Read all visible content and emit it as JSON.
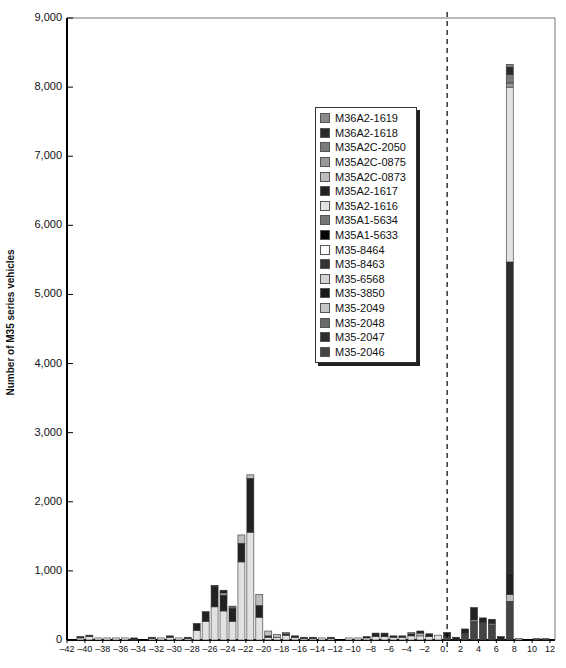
{
  "chart_data": {
    "type": "bar",
    "stacked": true,
    "title": "",
    "xlabel": "(x-axis title cut off at bottom of image)",
    "ylabel": "Number of M35 series vehicles",
    "ylim": [
      0,
      9000
    ],
    "xlim": [
      -42,
      12
    ],
    "yticks": [
      "0",
      "1,000",
      "2,000",
      "3,000",
      "4,000",
      "5,000",
      "6,000",
      "7,000",
      "8,000",
      "9,000"
    ],
    "xticks": [
      "-42",
      "-40",
      "-38",
      "-36",
      "-34",
      "-32",
      "-30",
      "-28",
      "-26",
      "-24",
      "-22",
      "-20",
      "-18",
      "-16",
      "-14",
      "-12",
      "-10",
      "-8",
      "-6",
      "-4",
      "-2",
      "0",
      "2",
      "4",
      "6",
      "8",
      "10",
      "12"
    ],
    "reference_line": {
      "x": 0.5,
      "style": "dashed"
    },
    "legend_position": "upper center-right, inside plot",
    "legend": [
      "M36A2-1619",
      "M36A2-1618",
      "M35A2C-2050",
      "M35A2C-0875",
      "M35A2C-0873",
      "M35A2-1617",
      "M35A2-1616",
      "M35A1-5634",
      "M35A1-5633",
      "M35-8464",
      "M35-8463",
      "M35-6568",
      "M35-3850",
      "M35-2049",
      "M35-2048",
      "M35-2047",
      "M35-2046"
    ],
    "legend_colors": [
      "#8a8a8a",
      "#2a2a2a",
      "#7a7a7a",
      "#999999",
      "#bdbdbd",
      "#222222",
      "#e2e2e2",
      "#777777",
      "#050505",
      "#ffffff",
      "#333333",
      "#d4d4d4",
      "#1a1a1a",
      "#c6c6c6",
      "#6a6a6a",
      "#2e2e2e",
      "#444444"
    ],
    "bars": [
      {
        "x": -41,
        "total": 50,
        "segments": [
          {
            "v": 30,
            "c": "#e2e2e2"
          },
          {
            "v": 20,
            "c": "#222222"
          }
        ]
      },
      {
        "x": -40,
        "total": 70,
        "segments": [
          {
            "v": 50,
            "c": "#e2e2e2"
          },
          {
            "v": 20,
            "c": "#222222"
          }
        ]
      },
      {
        "x": -39,
        "total": 30,
        "segments": [
          {
            "v": 30,
            "c": "#e2e2e2"
          }
        ]
      },
      {
        "x": -38,
        "total": 30,
        "segments": [
          {
            "v": 30,
            "c": "#e2e2e2"
          }
        ]
      },
      {
        "x": -37,
        "total": 30,
        "segments": [
          {
            "v": 30,
            "c": "#e2e2e2"
          }
        ]
      },
      {
        "x": -36,
        "total": 30,
        "segments": [
          {
            "v": 30,
            "c": "#e2e2e2"
          }
        ]
      },
      {
        "x": -35,
        "total": 30,
        "segments": [
          {
            "v": 10,
            "c": "#e2e2e2"
          },
          {
            "v": 20,
            "c": "#222222"
          }
        ]
      },
      {
        "x": -33,
        "total": 40,
        "segments": [
          {
            "v": 20,
            "c": "#e2e2e2"
          },
          {
            "v": 20,
            "c": "#222222"
          }
        ]
      },
      {
        "x": -32,
        "total": 30,
        "segments": [
          {
            "v": 30,
            "c": "#e2e2e2"
          }
        ]
      },
      {
        "x": -31,
        "total": 60,
        "segments": [
          {
            "v": 40,
            "c": "#e2e2e2"
          },
          {
            "v": 20,
            "c": "#222222"
          }
        ]
      },
      {
        "x": -30,
        "total": 30,
        "segments": [
          {
            "v": 30,
            "c": "#e2e2e2"
          }
        ]
      },
      {
        "x": -29,
        "total": 40,
        "segments": [
          {
            "v": 20,
            "c": "#e2e2e2"
          },
          {
            "v": 20,
            "c": "#222222"
          }
        ]
      },
      {
        "x": -28,
        "total": 240,
        "segments": [
          {
            "v": 140,
            "c": "#e2e2e2"
          },
          {
            "v": 100,
            "c": "#222222"
          }
        ]
      },
      {
        "x": -27,
        "total": 410,
        "segments": [
          {
            "v": 270,
            "c": "#e2e2e2"
          },
          {
            "v": 140,
            "c": "#222222"
          }
        ]
      },
      {
        "x": -26,
        "total": 790,
        "segments": [
          {
            "v": 480,
            "c": "#e2e2e2"
          },
          {
            "v": 300,
            "c": "#222222"
          },
          {
            "v": 10,
            "c": "#444444"
          }
        ]
      },
      {
        "x": -25,
        "total": 720,
        "segments": [
          {
            "v": 420,
            "c": "#e2e2e2"
          },
          {
            "v": 230,
            "c": "#222222"
          },
          {
            "v": 30,
            "c": "#bdbdbd"
          },
          {
            "v": 40,
            "c": "#222222"
          }
        ]
      },
      {
        "x": -24,
        "total": 490,
        "segments": [
          {
            "v": 270,
            "c": "#e2e2e2"
          },
          {
            "v": 190,
            "c": "#222222"
          },
          {
            "v": 30,
            "c": "#6a6a6a"
          }
        ]
      },
      {
        "x": -23,
        "total": 1520,
        "segments": [
          {
            "v": 1130,
            "c": "#e2e2e2"
          },
          {
            "v": 270,
            "c": "#222222"
          },
          {
            "v": 120,
            "c": "#bdbdbd"
          }
        ]
      },
      {
        "x": -22,
        "total": 2390,
        "segments": [
          {
            "v": 1560,
            "c": "#e2e2e2"
          },
          {
            "v": 780,
            "c": "#222222"
          },
          {
            "v": 50,
            "c": "#bdbdbd"
          }
        ]
      },
      {
        "x": -21,
        "total": 660,
        "segments": [
          {
            "v": 330,
            "c": "#e2e2e2"
          },
          {
            "v": 170,
            "c": "#222222"
          },
          {
            "v": 160,
            "c": "#bdbdbd"
          }
        ]
      },
      {
        "x": -20,
        "total": 130,
        "segments": [
          {
            "v": 40,
            "c": "#e2e2e2"
          },
          {
            "v": 20,
            "c": "#222222"
          },
          {
            "v": 70,
            "c": "#bdbdbd"
          }
        ]
      },
      {
        "x": -19,
        "total": 80,
        "segments": [
          {
            "v": 40,
            "c": "#e2e2e2"
          },
          {
            "v": 40,
            "c": "#bdbdbd"
          }
        ]
      },
      {
        "x": -18,
        "total": 110,
        "segments": [
          {
            "v": 70,
            "c": "#e2e2e2"
          },
          {
            "v": 20,
            "c": "#222222"
          },
          {
            "v": 20,
            "c": "#bdbdbd"
          }
        ]
      },
      {
        "x": -17,
        "total": 60,
        "segments": [
          {
            "v": 40,
            "c": "#e2e2e2"
          },
          {
            "v": 20,
            "c": "#222222"
          }
        ]
      },
      {
        "x": -16,
        "total": 40,
        "segments": [
          {
            "v": 20,
            "c": "#e2e2e2"
          },
          {
            "v": 20,
            "c": "#222222"
          }
        ]
      },
      {
        "x": -15,
        "total": 40,
        "segments": [
          {
            "v": 20,
            "c": "#e2e2e2"
          },
          {
            "v": 20,
            "c": "#222222"
          }
        ]
      },
      {
        "x": -14,
        "total": 30,
        "segments": [
          {
            "v": 30,
            "c": "#e2e2e2"
          }
        ]
      },
      {
        "x": -13,
        "total": 40,
        "segments": [
          {
            "v": 20,
            "c": "#e2e2e2"
          },
          {
            "v": 20,
            "c": "#222222"
          }
        ]
      },
      {
        "x": -11,
        "total": 30,
        "segments": [
          {
            "v": 30,
            "c": "#e2e2e2"
          }
        ]
      },
      {
        "x": -10,
        "total": 30,
        "segments": [
          {
            "v": 30,
            "c": "#e2e2e2"
          }
        ]
      },
      {
        "x": -9,
        "total": 50,
        "segments": [
          {
            "v": 30,
            "c": "#e2e2e2"
          },
          {
            "v": 20,
            "c": "#222222"
          }
        ]
      },
      {
        "x": -8,
        "total": 100,
        "segments": [
          {
            "v": 50,
            "c": "#e2e2e2"
          },
          {
            "v": 50,
            "c": "#222222"
          }
        ]
      },
      {
        "x": -7,
        "total": 100,
        "segments": [
          {
            "v": 50,
            "c": "#e2e2e2"
          },
          {
            "v": 50,
            "c": "#222222"
          }
        ]
      },
      {
        "x": -6,
        "total": 60,
        "segments": [
          {
            "v": 40,
            "c": "#e2e2e2"
          },
          {
            "v": 20,
            "c": "#222222"
          }
        ]
      },
      {
        "x": -5,
        "total": 60,
        "segments": [
          {
            "v": 40,
            "c": "#e2e2e2"
          },
          {
            "v": 20,
            "c": "#222222"
          }
        ]
      },
      {
        "x": -4,
        "total": 110,
        "segments": [
          {
            "v": 60,
            "c": "#e2e2e2"
          },
          {
            "v": 30,
            "c": "#222222"
          },
          {
            "v": 20,
            "c": "#bdbdbd"
          }
        ]
      },
      {
        "x": -3,
        "total": 130,
        "segments": [
          {
            "v": 60,
            "c": "#e2e2e2"
          },
          {
            "v": 40,
            "c": "#bdbdbd"
          },
          {
            "v": 30,
            "c": "#222222"
          }
        ]
      },
      {
        "x": -2,
        "total": 90,
        "segments": [
          {
            "v": 50,
            "c": "#e2e2e2"
          },
          {
            "v": 40,
            "c": "#222222"
          }
        ]
      },
      {
        "x": -1,
        "total": 70,
        "segments": [
          {
            "v": 70,
            "c": "#e2e2e2"
          }
        ]
      },
      {
        "x": 0,
        "total": 110,
        "segments": [
          {
            "v": 50,
            "c": "#444444"
          },
          {
            "v": 60,
            "c": "#222222"
          }
        ]
      },
      {
        "x": 1,
        "total": 40,
        "segments": [
          {
            "v": 40,
            "c": "#222222"
          }
        ]
      },
      {
        "x": 2,
        "total": 160,
        "segments": [
          {
            "v": 100,
            "c": "#444444"
          },
          {
            "v": 60,
            "c": "#222222"
          }
        ]
      },
      {
        "x": 3,
        "total": 470,
        "segments": [
          {
            "v": 270,
            "c": "#444444"
          },
          {
            "v": 20,
            "c": "#bdbdbd"
          },
          {
            "v": 180,
            "c": "#222222"
          }
        ]
      },
      {
        "x": 4,
        "total": 320,
        "segments": [
          {
            "v": 260,
            "c": "#444444"
          },
          {
            "v": 60,
            "c": "#222222"
          }
        ]
      },
      {
        "x": 5,
        "total": 300,
        "segments": [
          {
            "v": 220,
            "c": "#444444"
          },
          {
            "v": 20,
            "c": "#bdbdbd"
          },
          {
            "v": 60,
            "c": "#222222"
          }
        ]
      },
      {
        "x": 6,
        "total": 50,
        "segments": [
          {
            "v": 50,
            "c": "#222222"
          }
        ]
      },
      {
        "x": 7,
        "total": 8330,
        "segments": [
          {
            "v": 560,
            "c": "#444444"
          },
          {
            "v": 100,
            "c": "#bdbdbd"
          },
          {
            "v": 300,
            "c": "#222222"
          },
          {
            "v": 4510,
            "c": "#2e2e2e"
          },
          {
            "v": 2530,
            "c": "#e2e2e2"
          },
          {
            "v": 60,
            "c": "#999999"
          },
          {
            "v": 120,
            "c": "#7a7a7a"
          },
          {
            "v": 110,
            "c": "#2a2a2a"
          },
          {
            "v": 40,
            "c": "#8a8a8a"
          }
        ]
      },
      {
        "x": 8,
        "total": 20,
        "segments": [
          {
            "v": 20,
            "c": "#bdbdbd"
          }
        ]
      },
      {
        "x": 10,
        "total": 20,
        "segments": [
          {
            "v": 20,
            "c": "#444444"
          }
        ]
      },
      {
        "x": 11,
        "total": 20,
        "segments": [
          {
            "v": 20,
            "c": "#444444"
          }
        ]
      }
    ]
  }
}
